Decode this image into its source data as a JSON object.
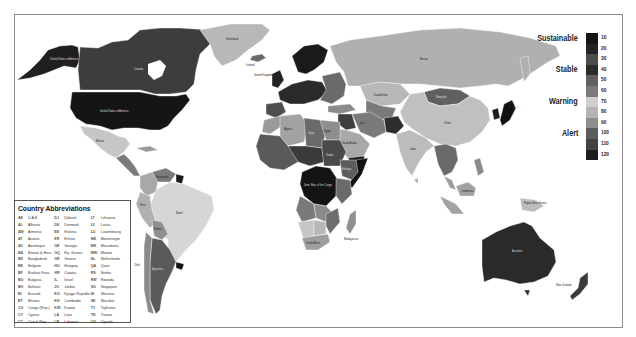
{
  "legend": {
    "categories": [
      {
        "label": "Sustainable",
        "y": 5
      },
      {
        "label": "Stable",
        "y": 36
      },
      {
        "label": "Warning",
        "y": 68
      },
      {
        "label": "Alert",
        "y": 100
      }
    ],
    "scale": [
      {
        "value": "10",
        "color": "#161616"
      },
      {
        "value": "20",
        "color": "#242424"
      },
      {
        "value": "30",
        "color": "#4c4c4c"
      },
      {
        "value": "40",
        "color": "#2c2c2c"
      },
      {
        "value": "50",
        "color": "#606060"
      },
      {
        "value": "60",
        "color": "#7a7a7a"
      },
      {
        "value": "70",
        "color": "#cfcfcf"
      },
      {
        "value": "80",
        "color": "#b4b4b4"
      },
      {
        "value": "90",
        "color": "#8e8e8e"
      },
      {
        "value": "100",
        "color": "#5c5c5c"
      },
      {
        "value": "110",
        "color": "#424242"
      },
      {
        "value": "120",
        "color": "#1e1e1e"
      }
    ]
  },
  "abbreviations": {
    "title": "Country Abbreviations",
    "columns": [
      [
        {
          "code": "AE",
          "name": "U.A.E."
        },
        {
          "code": "AL",
          "name": "Albania"
        },
        {
          "code": "AM",
          "name": "Armenia"
        },
        {
          "code": "AT",
          "name": "Austria"
        },
        {
          "code": "AZ",
          "name": "Azerbaijan"
        },
        {
          "code": "BA",
          "name": "Bosnia & Herz."
        },
        {
          "code": "BD",
          "name": "Bangladesh"
        },
        {
          "code": "BE",
          "name": "Belgium"
        },
        {
          "code": "BF",
          "name": "Burkina Faso"
        },
        {
          "code": "BG",
          "name": "Bulgaria"
        },
        {
          "code": "BH",
          "name": "Bahrain"
        },
        {
          "code": "BI",
          "name": "Burundi"
        },
        {
          "code": "BT",
          "name": "Bhutan"
        },
        {
          "code": "CG",
          "name": "Congo (Rep.)"
        },
        {
          "code": "CY",
          "name": "Cyprus"
        },
        {
          "code": "CZ",
          "name": "Czech Rep."
        }
      ],
      [
        {
          "code": "DJ",
          "name": "Djibouti"
        },
        {
          "code": "DK",
          "name": "Denmark"
        },
        {
          "code": "EE",
          "name": "Estonia"
        },
        {
          "code": "ER",
          "name": "Eritrea"
        },
        {
          "code": "GE",
          "name": "Georgia"
        },
        {
          "code": "GQ",
          "name": "Eq. Guinea"
        },
        {
          "code": "GR",
          "name": "Greece"
        },
        {
          "code": "HU",
          "name": "Hungary"
        },
        {
          "code": "HR",
          "name": "Croatia"
        },
        {
          "code": "IL",
          "name": "Israel"
        },
        {
          "code": "JO",
          "name": "Jordan"
        },
        {
          "code": "KG",
          "name": "Kyrgyz Republic"
        },
        {
          "code": "KH",
          "name": "Cambodia"
        },
        {
          "code": "KW",
          "name": "Kuwait"
        },
        {
          "code": "LA",
          "name": "Laos"
        },
        {
          "code": "LB",
          "name": "Lebanon"
        }
      ],
      [
        {
          "code": "LT",
          "name": "Lithuania"
        },
        {
          "code": "LV",
          "name": "Latvia"
        },
        {
          "code": "LU",
          "name": "Luxembourg"
        },
        {
          "code": "ME",
          "name": "Montenegro"
        },
        {
          "code": "MK",
          "name": "Macedonia"
        },
        {
          "code": "MW",
          "name": "Malawi"
        },
        {
          "code": "NL",
          "name": "Netherlands"
        },
        {
          "code": "QA",
          "name": "Qatar"
        },
        {
          "code": "RS",
          "name": "Serbia"
        },
        {
          "code": "RW",
          "name": "Rwanda"
        },
        {
          "code": "SG",
          "name": "Singapore"
        },
        {
          "code": "SI",
          "name": "Slovenia"
        },
        {
          "code": "SK",
          "name": "Slovakia"
        },
        {
          "code": "TJ",
          "name": "Tajikistan"
        },
        {
          "code": "TN",
          "name": "Tunisia"
        },
        {
          "code": "UG",
          "name": "Uganda"
        }
      ]
    ]
  },
  "map_labels": {
    "usa": "United States of America",
    "canada": "Canada",
    "alaska": "United States of America",
    "greenland": "Greenland",
    "russia": "Russia",
    "china": "China",
    "mongolia": "Mongolia",
    "india": "India",
    "brazil": "Brazil",
    "argentina": "Argentina",
    "australia": "Australia",
    "new_zealand": "New Zealand",
    "mexico": "Mexico",
    "kazakhstan": "Kazakhstan",
    "algeria": "Algeria",
    "dr_congo": "Dem. Rep. of the Congo",
    "saudi": "Saudi Arabia",
    "iran": "Iran",
    "indonesia": "Indonesia",
    "png": "Papua New Guinea",
    "uk": "United Kingdom",
    "iceland": "Iceland",
    "chile": "Chile",
    "peru": "Peru",
    "bolivia": "Bolivia",
    "venezuela": "Venezuela",
    "south_africa": "South Africa",
    "madagascar": "Madagascar",
    "egypt": "Egypt",
    "libya": "Libya",
    "sudan": "Sudan",
    "ethiopia": "Ethiopia",
    "japan": "Japan"
  }
}
